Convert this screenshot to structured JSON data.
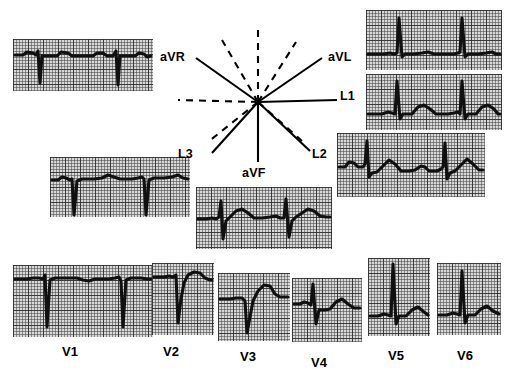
{
  "figure": {
    "type": "ecg-12-lead-with-hexaxial-reference",
    "background_color": "#ffffff",
    "trace_color": "#101010",
    "grid_paper_color": "#d8d8d8"
  },
  "axis_diagram": {
    "name": "hexaxial-reference-system",
    "center": {
      "x": 108,
      "y": 88
    },
    "labels": [
      {
        "id": "aVR",
        "text": "aVR",
        "x": 10,
        "y": 36,
        "degrees": -150
      },
      {
        "id": "aVL",
        "text": "aVL",
        "x": 178,
        "y": 36,
        "degrees": -30
      },
      {
        "id": "L1",
        "text": "L1",
        "x": 190,
        "y": 82,
        "degrees": 0
      },
      {
        "id": "L2",
        "text": "L2",
        "x": 176,
        "y": 136,
        "degrees": 60
      },
      {
        "id": "L3",
        "text": "L3",
        "x": 28,
        "y": 136,
        "degrees": 120
      },
      {
        "id": "aVF",
        "text": "aVF",
        "x": 92,
        "y": 155,
        "degrees": 90
      }
    ],
    "solid_rays": [
      "aVR",
      "aVL",
      "L1",
      "L2",
      "L3",
      "aVF"
    ],
    "dashed_rays_note": "negative half of each lead axis drawn dashed"
  },
  "strips": [
    {
      "id": "strip-aVR",
      "lead": "aVR",
      "position": {
        "x": 13,
        "y": 39,
        "w": 140,
        "h": 52
      },
      "morphology": "deep negative QRS, inverted P and T — all deflections negative",
      "beats": 2
    },
    {
      "id": "strip-aVL",
      "lead": "aVL",
      "position": {
        "x": 366,
        "y": 10,
        "w": 136,
        "h": 60
      },
      "morphology": "tall upright R waves, small T waves",
      "beats": 2
    },
    {
      "id": "strip-L1",
      "lead": "L1",
      "position": {
        "x": 366,
        "y": 74,
        "w": 136,
        "h": 56
      },
      "morphology": "tall upright R waves with upright T waves",
      "beats": 2
    },
    {
      "id": "strip-L2",
      "lead": "L2",
      "position": {
        "x": 337,
        "y": 133,
        "w": 148,
        "h": 64
      },
      "morphology": "sharp negative QRS deflections with upright T waves",
      "beats": 2
    },
    {
      "id": "strip-L3",
      "lead": "L3",
      "position": {
        "x": 50,
        "y": 157,
        "w": 140,
        "h": 60
      },
      "morphology": "deep negative QS complexes on elevated baseline",
      "beats": 2
    },
    {
      "id": "strip-aVF",
      "lead": "aVF",
      "position": {
        "x": 196,
        "y": 187,
        "w": 136,
        "h": 62
      },
      "morphology": "biphasic QRS, rS with broad upright T waves",
      "beats": 2
    },
    {
      "id": "strip-V1",
      "lead": "V1",
      "position": {
        "x": 13,
        "y": 265,
        "w": 140,
        "h": 72
      },
      "morphology": "rS pattern — deep S waves, small r",
      "beats": 2
    },
    {
      "id": "strip-V2",
      "lead": "V2",
      "position": {
        "x": 152,
        "y": 263,
        "w": 62,
        "h": 72
      },
      "morphology": "deep S wave followed by tall upright T wave",
      "beats": 1
    },
    {
      "id": "strip-V3",
      "lead": "V3",
      "position": {
        "x": 218,
        "y": 273,
        "w": 72,
        "h": 68
      },
      "morphology": "rS with prominent upright T wave",
      "beats": 1
    },
    {
      "id": "strip-V4",
      "lead": "V4",
      "position": {
        "x": 292,
        "y": 278,
        "w": 70,
        "h": 64
      },
      "morphology": "R wave with S and upright T wave",
      "beats": 1
    },
    {
      "id": "strip-V5",
      "lead": "V5",
      "position": {
        "x": 368,
        "y": 258,
        "w": 62,
        "h": 78
      },
      "morphology": "tall R wave with upright T wave",
      "beats": 1
    },
    {
      "id": "strip-V6",
      "lead": "V6",
      "position": {
        "x": 437,
        "y": 263,
        "w": 64,
        "h": 72
      },
      "morphology": "tall R wave with upright T wave",
      "beats": 1
    }
  ],
  "precordial_labels": [
    {
      "id": "V1",
      "text": "V1",
      "x": 62,
      "y": 344
    },
    {
      "id": "V2",
      "text": "V2",
      "x": 163,
      "y": 344
    },
    {
      "id": "V3",
      "text": "V3",
      "x": 240,
      "y": 349
    },
    {
      "id": "V4",
      "text": "V4",
      "x": 311,
      "y": 355
    },
    {
      "id": "V5",
      "text": "V5",
      "x": 388,
      "y": 348
    },
    {
      "id": "V6",
      "text": "V6",
      "x": 457,
      "y": 348
    }
  ]
}
